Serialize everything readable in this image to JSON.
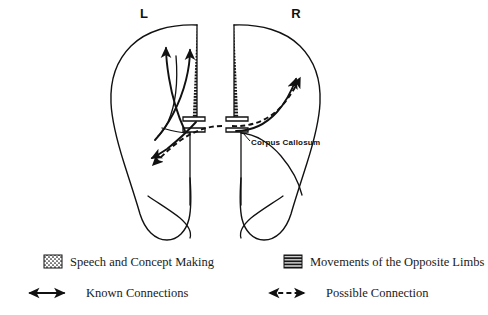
{
  "figure": {
    "type": "anatomical-diagram",
    "hemisphere_labels": {
      "left": "L",
      "right": "R"
    },
    "annotations": [
      {
        "id": "corpus-callosum",
        "label": "Corpus Callosum"
      }
    ]
  },
  "legend": {
    "entries": [
      {
        "id": "speech",
        "swatch": "dotted-swatch",
        "label": "Speech and Concept Making"
      },
      {
        "id": "movements",
        "swatch": "hatched-swatch",
        "label": "Movements of the Opposite Limbs"
      },
      {
        "id": "known",
        "swatch": "double-arrow-solid",
        "label": "Known Connections"
      },
      {
        "id": "possible",
        "swatch": "double-arrow-dashed",
        "label": "Possible Connection"
      }
    ]
  },
  "colors": {
    "ink": "#111111",
    "background": "#ffffff"
  }
}
